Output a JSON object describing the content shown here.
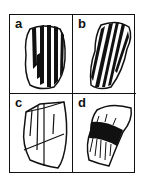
{
  "figure": {
    "panels": [
      {
        "id": "a",
        "label": "a",
        "description": "grain with alternating broad dark and light parallel stripes (twinning)"
      },
      {
        "id": "b",
        "label": "b",
        "description": "elongated grain with oblique parallel dark lamellae"
      },
      {
        "id": "c",
        "label": "c",
        "description": "prismatic grain outline with cleavage/fracture lines"
      },
      {
        "id": "d",
        "label": "d",
        "description": "curved grain with dark band of undulose extinction"
      }
    ],
    "colors": {
      "ink": "#111111",
      "background": "#ffffff"
    }
  }
}
